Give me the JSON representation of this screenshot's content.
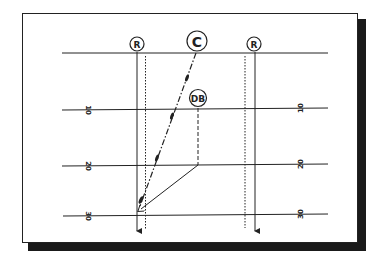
{
  "diagram": {
    "type": "football-play",
    "yard_lines": [
      {
        "label": "",
        "y": 53
      },
      {
        "label": "10",
        "y": 108
      },
      {
        "label": "20",
        "y": 165
      },
      {
        "label": "30",
        "y": 215
      }
    ],
    "left_yard_labels": [
      "10",
      "20",
      "30"
    ],
    "right_yard_labels": [
      "10",
      "20",
      "30"
    ],
    "players": [
      {
        "id": "r-left",
        "label": "R",
        "x": 137,
        "y": 44,
        "r": 7
      },
      {
        "id": "c",
        "label": "C",
        "x": 197,
        "y": 41,
        "r": 10
      },
      {
        "id": "r-right",
        "label": "R",
        "x": 254,
        "y": 44,
        "r": 7
      },
      {
        "id": "db",
        "label": "DB",
        "x": 198,
        "y": 98,
        "r": 8
      }
    ],
    "colors": {
      "line": "#222222",
      "shadow": "#1a1a1a",
      "background": "#ffffff"
    }
  }
}
